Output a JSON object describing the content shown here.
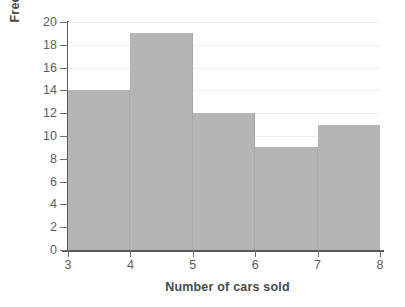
{
  "chart_data": {
    "type": "bar",
    "title": "",
    "subtitle": "",
    "xlabel": "Number of cars sold",
    "ylabel": "Frequency",
    "categories": [
      "3-4",
      "4-5",
      "5-6",
      "6-7",
      "7-8"
    ],
    "bin_edges": [
      3,
      4,
      5,
      6,
      7,
      8
    ],
    "values": [
      14,
      19,
      12,
      9,
      11
    ],
    "x_tick_labels": [
      "3",
      "4",
      "5",
      "6",
      "7",
      "8"
    ],
    "y_tick_labels": [
      "0",
      "2",
      "4",
      "6",
      "8",
      "10",
      "12",
      "14",
      "16",
      "18",
      "20"
    ],
    "y_tick_values": [
      0,
      2,
      4,
      6,
      8,
      10,
      12,
      14,
      16,
      18,
      20
    ],
    "xlim": [
      3,
      8
    ],
    "ylim": [
      0,
      20
    ],
    "grid": "horizontal",
    "legend": "none",
    "bar_color": "#b5b5b5",
    "axis_color": "#55595c",
    "gridline_color": "#f0f0f0",
    "text_color": "#4a4a4a",
    "background": "#ffffff"
  }
}
